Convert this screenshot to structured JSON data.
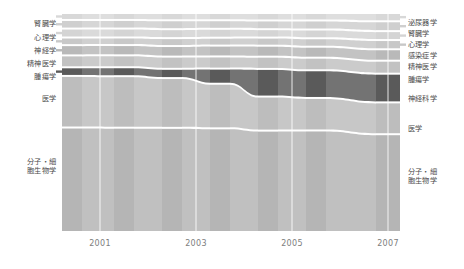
{
  "figure": {
    "type": "alluvial",
    "background": "#ffffff",
    "axis_label_color": "#7d7d7d",
    "node_label_color": "#4a4a4a"
  },
  "axis": {
    "name": "year-axis",
    "ticks": [
      "2001",
      "2003",
      "2005",
      "2007"
    ],
    "tick_x": [
      100,
      196,
      292,
      388
    ]
  },
  "left_labels": [
    {
      "text": "腎臓学",
      "y": 20
    },
    {
      "text": "心理学",
      "y": 34
    },
    {
      "text": "神経学",
      "y": 47
    },
    {
      "text": "精神医学",
      "y": 60
    },
    {
      "text": "腫瘍学",
      "y": 73
    },
    {
      "text": "医学",
      "y": 95
    },
    {
      "text": "分子・細\n胞生物学",
      "y": 157
    }
  ],
  "right_labels": [
    {
      "text": "泌尿器学",
      "y": 19
    },
    {
      "text": "腎臓学",
      "y": 30
    },
    {
      "text": "心理学",
      "y": 41
    },
    {
      "text": "感染症学",
      "y": 52
    },
    {
      "text": "精神医学",
      "y": 63
    },
    {
      "text": "腫瘍学",
      "y": 76
    },
    {
      "text": "神経科学",
      "y": 95
    },
    {
      "text": "医学",
      "y": 125
    },
    {
      "text": "分子・細\n胞生物学",
      "y": 167
    }
  ],
  "chart_data": {
    "type": "area",
    "title": "",
    "xlabel": "",
    "ylabel": "",
    "categories": [
      "2001",
      "2002",
      "2003",
      "2004",
      "2005",
      "2006",
      "2007"
    ],
    "x_positions": [
      72,
      124,
      172,
      220,
      268,
      316,
      388
    ],
    "series": [
      {
        "name": "泌尿器学",
        "color": "#d8d8d8",
        "values": [
          3.0,
          3.0,
          3.2,
          3.2,
          3.4,
          3.4,
          4.0
        ]
      },
      {
        "name": "腎臓学",
        "color": "#cfcfcf",
        "values": [
          4.0,
          4.0,
          4.2,
          4.0,
          4.2,
          4.4,
          5.0
        ]
      },
      {
        "name": "心理学",
        "color": "#d4d4d4",
        "values": [
          4.2,
          4.2,
          4.2,
          4.2,
          4.0,
          4.2,
          4.4
        ]
      },
      {
        "name": "感染症学",
        "color": "#c8c8c8",
        "values": [
          3.4,
          3.4,
          3.6,
          3.6,
          3.8,
          4.0,
          4.6
        ]
      },
      {
        "name": "精神医学",
        "color": "#b9b9b9",
        "values": [
          5.0,
          5.0,
          5.2,
          5.4,
          5.6,
          5.6,
          6.0
        ]
      },
      {
        "name": "腫瘍学",
        "color": "#c2c2c2",
        "values": [
          6.0,
          6.0,
          6.2,
          6.2,
          6.4,
          6.6,
          7.0
        ]
      },
      {
        "name": "神経科学",
        "color": "#5a5a5a",
        "values": [
          4.0,
          4.2,
          4.4,
          8.0,
          16.0,
          16.0,
          17.0
        ]
      },
      {
        "name": "医学",
        "color": "#bdbdbd",
        "values": [
          30.0,
          30.0,
          29.0,
          26.0,
          20.0,
          19.0,
          19.0
        ]
      },
      {
        "name": "分子・細胞生物学",
        "color": "#b5b5b5",
        "values": [
          62.0,
          62.0,
          62.0,
          62.0,
          62.0,
          62.0,
          61.0
        ]
      }
    ],
    "grid": true,
    "legend_position": "outside-left-and-right"
  }
}
